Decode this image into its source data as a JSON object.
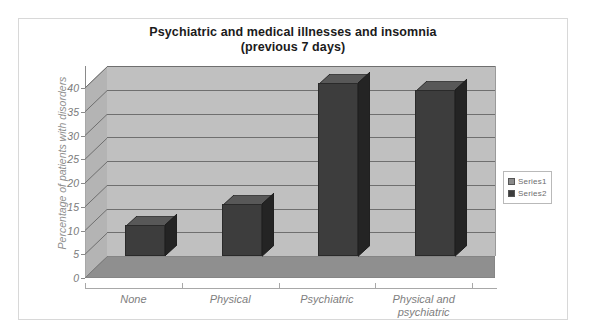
{
  "chart_data": {
    "type": "bar",
    "title": "Psychiatric and medical illnesses and insomnia (previous 7 days)",
    "title_line1": "Psychiatric and medical illnesses and insomnia",
    "title_line2": "(previous 7 days)",
    "xlabel": "",
    "ylabel": "Percentage of patients with disorders",
    "categories": [
      "None",
      "Physical",
      "Psychiatric",
      "Physical and psychiatric"
    ],
    "category_lines": [
      [
        "None"
      ],
      [
        "Physical"
      ],
      [
        "Psychiatric"
      ],
      [
        "Physical and",
        "psychiatric"
      ]
    ],
    "values": [
      6.5,
      11,
      36.5,
      35
    ],
    "ylim": [
      0,
      40
    ],
    "ytick_step": 5,
    "yticks": [
      0,
      5,
      10,
      15,
      20,
      25,
      30,
      35,
      40
    ],
    "ytick_labels": [
      "0",
      "5",
      "10",
      "15",
      "20",
      "25",
      "30",
      "35",
      "40"
    ],
    "grid": true,
    "grid_axis": "y",
    "legend_position": "right",
    "legend": [
      "Series1",
      "Series2"
    ],
    "series": [
      {
        "name": "Series1",
        "values": [
          6.5,
          11,
          36.5,
          35
        ]
      }
    ],
    "style": "3d-column",
    "colors": {
      "bar_front": "#3d3d3d",
      "bar_side": "#242424",
      "bar_top": "#585858",
      "back_wall": "#c0c0c0",
      "side_wall": "#b4b4b4",
      "floor": "#8f8f8f",
      "gridline": "#6f6f6f",
      "axis_text": "#7a7a7a",
      "title_text": "#1b1b1b",
      "frame_border": "#d8d8d8",
      "legend_swatch_series1": "#8a8a8a",
      "legend_swatch_series2": "#3d3d3d"
    }
  },
  "legend": {
    "items": [
      {
        "label": "Series1",
        "color": "#8a8a8a"
      },
      {
        "label": "Series2",
        "color": "#3d3d3d"
      }
    ]
  }
}
